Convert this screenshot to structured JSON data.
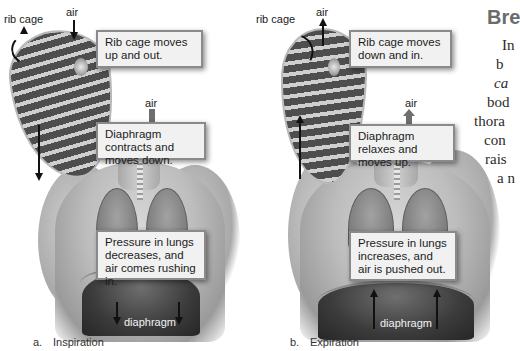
{
  "figure": {
    "panels": [
      {
        "id": "a",
        "caption_letter": "a.",
        "caption_label": "Inspiration",
        "labels": {
          "rib_cage": "rib cage",
          "air_top": "air",
          "air_mid": "air",
          "diaphragm": "diaphragm"
        },
        "callouts": [
          "Rib cage moves up and out.",
          "Diaphragm contracts and moves down.",
          "Pressure in lungs decreases, and air comes rushing in."
        ]
      },
      {
        "id": "b",
        "caption_letter": "b.",
        "caption_label": "Expiration",
        "labels": {
          "rib_cage": "rib cage",
          "air_top": "air",
          "air_mid": "air",
          "diaphragm": "diaphragm"
        },
        "callouts": [
          "Rib cage moves down and in.",
          "Diaphragm relaxes and moves up.",
          "Pressure in lungs increases, and air is pushed out."
        ]
      }
    ]
  },
  "side_text": {
    "heading": "Bre",
    "lines": [
      "In",
      "b",
      "ca",
      "bod",
      "thora",
      "con",
      "rais",
      "a n"
    ]
  }
}
